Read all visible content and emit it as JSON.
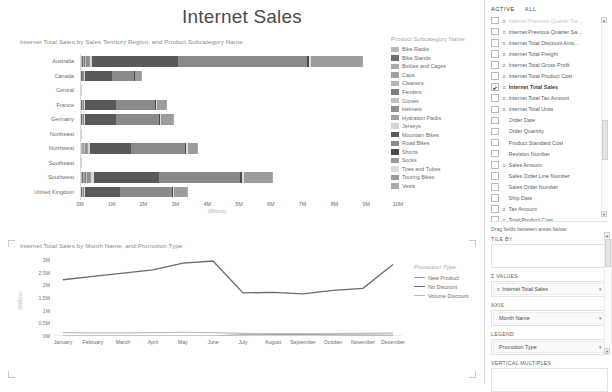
{
  "report": {
    "title": "Internet Sales"
  },
  "bar_visual": {
    "title": "Internet Total Sales by Sales Territory Region, and Product Subcategory Name",
    "legend_title": "Product Subcategory Name",
    "x_axis_title": "(Millions)"
  },
  "line_visual": {
    "title": "Internet Total Sales by Month Name, and Promotion Type",
    "legend_title": "Promotion Type",
    "y_axis_title": "(Millions)"
  },
  "pane": {
    "tabs": [
      {
        "label": "ACTIVE",
        "active": true
      },
      {
        "label": "ALL",
        "active": false
      }
    ],
    "fields": [
      {
        "label": "Internet Previous Quarter Sa...",
        "checked": false,
        "icon": "sigma-icon",
        "faded": true,
        "clipped": true
      },
      {
        "label": "Internet Previous Quarter Sa...",
        "checked": false,
        "icon": "sigma-icon"
      },
      {
        "label": "Internet Total Discount Amo...",
        "checked": false,
        "icon": "sigma-icon"
      },
      {
        "label": "Internet Total Freight",
        "checked": false,
        "icon": "sigma-icon"
      },
      {
        "label": "Internet Total Gross Profit",
        "checked": false,
        "icon": "sigma-icon"
      },
      {
        "label": "Internet Total Product Cost",
        "checked": false,
        "icon": "sigma-icon"
      },
      {
        "label": "Internet Total Sales",
        "checked": true,
        "icon": "sigma-icon",
        "selected": true
      },
      {
        "label": "Internet Total Tax Amount",
        "checked": false,
        "icon": "sigma-icon"
      },
      {
        "label": "Internet Total Units",
        "checked": false,
        "icon": "sigma-icon"
      },
      {
        "label": "Order Date",
        "checked": false,
        "icon": ""
      },
      {
        "label": "Order Quantity",
        "checked": false,
        "icon": ""
      },
      {
        "label": "Product Standard Cost",
        "checked": false,
        "icon": ""
      },
      {
        "label": "Revision Number",
        "checked": false,
        "icon": ""
      },
      {
        "label": "Sales Amount",
        "checked": false,
        "icon": "sigma-icon"
      },
      {
        "label": "Sales Order Line Number",
        "checked": false,
        "icon": ""
      },
      {
        "label": "Sales Order Number",
        "checked": false,
        "icon": ""
      },
      {
        "label": "Ship Date",
        "checked": false,
        "icon": ""
      },
      {
        "label": "Tax Amount",
        "checked": false,
        "icon": "sigma-icon"
      },
      {
        "label": "Total Product Cost",
        "checked": false,
        "icon": "sigma-icon"
      },
      {
        "label": "Unit Price",
        "checked": false,
        "icon": ""
      },
      {
        "label": "Unit Price Discount Pct",
        "checked": false,
        "icon": ""
      }
    ],
    "wells_hint": "Drag fields between areas below",
    "wells": [
      {
        "label": "TILE BY",
        "chip": null
      },
      {
        "label": "Σ VALUES",
        "chip": {
          "text": "Internet Total Sales",
          "icon": "measure-icon"
        }
      },
      {
        "label": "AXIS",
        "chip": {
          "text": "Month Name",
          "icon": ""
        }
      },
      {
        "label": "LEGEND",
        "chip": {
          "text": "Promotion Type",
          "icon": ""
        }
      },
      {
        "label": "VERTICAL MULTIPLES",
        "chip": null
      }
    ]
  },
  "chart_data": [
    {
      "type": "bar",
      "orientation": "horizontal",
      "stacked": true,
      "title": "Internet Total Sales by Sales Territory Region, and Product Subcategory Name",
      "xlabel": "(Millions)",
      "ylabel": "",
      "xlim": [
        0,
        10
      ],
      "xticks": [
        "0M",
        "1M",
        "2M",
        "3M",
        "4M",
        "5M",
        "6M",
        "7M",
        "8M",
        "9M",
        "10M"
      ],
      "grid": false,
      "legend_position": "right",
      "categories": [
        "Australia",
        "Canada",
        "Central",
        "France",
        "Germany",
        "Northeast",
        "Northwest",
        "Southeast",
        "Southwest",
        "United Kingdom"
      ],
      "series": [
        {
          "name": "Bike Racks",
          "color": "#b9b9b9",
          "values": [
            0.03,
            0.01,
            0,
            0.01,
            0.01,
            0,
            0.02,
            0,
            0.03,
            0.01
          ]
        },
        {
          "name": "Bike Stands",
          "color": "#6f6f6f",
          "values": [
            0.03,
            0.01,
            0,
            0.01,
            0.01,
            0,
            0.02,
            0,
            0.03,
            0.01
          ]
        },
        {
          "name": "Bottles and Cages",
          "color": "#a8a8a8",
          "values": [
            0.02,
            0.01,
            0,
            0.01,
            0.01,
            0,
            0.02,
            0,
            0.03,
            0.01
          ]
        },
        {
          "name": "Caps",
          "color": "#9e9e9e",
          "values": [
            0.02,
            0.01,
            0,
            0.01,
            0.01,
            0,
            0.02,
            0,
            0.03,
            0.01
          ]
        },
        {
          "name": "Cleaners",
          "color": "#b3b3b3",
          "values": [
            0.01,
            0.0,
            0,
            0.01,
            0.01,
            0,
            0.01,
            0,
            0.02,
            0.01
          ]
        },
        {
          "name": "Fenders",
          "color": "#7c7c7c",
          "values": [
            0.03,
            0.01,
            0,
            0.01,
            0.01,
            0,
            0.02,
            0,
            0.03,
            0.01
          ]
        },
        {
          "name": "Gloves",
          "color": "#c2c2c2",
          "values": [
            0.02,
            0.01,
            0,
            0.01,
            0.01,
            0,
            0.02,
            0,
            0.02,
            0.01
          ]
        },
        {
          "name": "Helmets",
          "color": "#8f8f8f",
          "values": [
            0.08,
            0.03,
            0,
            0.03,
            0.03,
            0,
            0.06,
            0,
            0.09,
            0.03
          ]
        },
        {
          "name": "Hydration Packs",
          "color": "#a0a0a0",
          "values": [
            0.04,
            0.01,
            0,
            0.01,
            0.01,
            0,
            0.03,
            0,
            0.04,
            0.01
          ]
        },
        {
          "name": "Jerseys",
          "color": "#d4d4d4",
          "values": [
            0.07,
            0.02,
            0,
            0.03,
            0.03,
            0,
            0.05,
            0,
            0.08,
            0.03
          ]
        },
        {
          "name": "Mountain Bikes",
          "color": "#595959",
          "values": [
            2.7,
            0.85,
            0,
            0.95,
            0.97,
            0,
            1.3,
            0,
            2.05,
            1.08
          ]
        },
        {
          "name": "Road Bikes",
          "color": "#8a8a8a",
          "values": [
            4.05,
            0.7,
            0,
            1.25,
            1.35,
            0,
            1.7,
            0,
            2.55,
            1.65
          ]
        },
        {
          "name": "Shorts",
          "color": "#4a4a4a",
          "values": [
            0.06,
            0.02,
            0,
            0.02,
            0.02,
            0,
            0.04,
            0,
            0.06,
            0.02
          ]
        },
        {
          "name": "Socks",
          "color": "#9a9a9a",
          "values": [
            0.01,
            0.0,
            0,
            0.01,
            0.01,
            0,
            0.01,
            0,
            0.01,
            0.01
          ]
        },
        {
          "name": "Tires and Tubes",
          "color": "#dcdcdc",
          "values": [
            0.05,
            0.02,
            0,
            0.02,
            0.02,
            0,
            0.04,
            0,
            0.05,
            0.02
          ]
        },
        {
          "name": "Touring Bikes",
          "color": "#9c9c9c",
          "values": [
            1.62,
            0.18,
            0,
            0.3,
            0.37,
            0,
            0.3,
            0,
            0.88,
            0.42
          ]
        },
        {
          "name": "Vests",
          "color": "#aaaaaa",
          "values": [
            0.04,
            0.01,
            0,
            0.01,
            0.01,
            0,
            0.02,
            0,
            0.04,
            0.01
          ]
        }
      ],
      "totals": [
        8.88,
        1.9,
        0,
        2.7,
        2.88,
        0,
        3.68,
        0,
        5.98,
        3.35
      ]
    },
    {
      "type": "line",
      "title": "Internet Total Sales by Month Name, and Promotion Type",
      "xlabel": "",
      "ylabel": "(Millions)",
      "ylim": [
        0,
        3
      ],
      "yticks": [
        "0M",
        "0.5M",
        "1M",
        "1.5M",
        "2M",
        "2.5M",
        "3M"
      ],
      "grid": false,
      "legend_position": "right",
      "categories": [
        "January",
        "February",
        "March",
        "April",
        "May",
        "June",
        "July",
        "August",
        "September",
        "October",
        "November",
        "December"
      ],
      "series": [
        {
          "name": "New Product",
          "color": "#9a9a9a",
          "values": [
            0.0,
            0.0,
            0.0,
            0.0,
            0.0,
            0.0,
            0.04,
            0.05,
            0.05,
            0.04,
            0.03,
            0.02
          ]
        },
        {
          "name": "No Discount",
          "color": "#6b6b6b",
          "values": [
            2.22,
            2.35,
            2.48,
            2.61,
            2.88,
            2.96,
            1.7,
            1.72,
            1.66,
            1.8,
            1.88,
            2.82
          ]
        },
        {
          "name": "Volume Discount",
          "color": "#bdbdbd",
          "values": [
            0.13,
            0.12,
            0.12,
            0.13,
            0.14,
            0.13,
            0.1,
            0.09,
            0.09,
            0.09,
            0.1,
            0.11
          ]
        }
      ]
    }
  ]
}
